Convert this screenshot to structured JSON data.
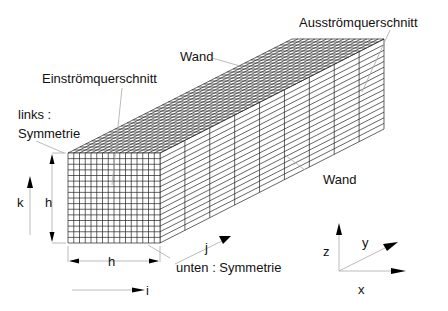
{
  "labels": {
    "outlet": "Ausströmquerschnitt",
    "wall_top": "Wand",
    "inlet": "Einströmquerschnitt",
    "left_line1": "links :",
    "left_line2": "Symmetrie",
    "wall_side": "Wand",
    "bottom": "unten : Symmetrie",
    "dim_height": "h",
    "dim_width": "h",
    "index_k": "k",
    "index_j": "j",
    "index_i": "i",
    "axis_z": "z",
    "axis_y": "y",
    "axis_x": "x"
  },
  "grid": {
    "front_cols": 16,
    "front_rows": 16,
    "depth_cells": 38,
    "depth_sections": 9
  },
  "colors": {
    "line": "#222222",
    "leader": "#aaaaaa",
    "text": "#111111"
  }
}
